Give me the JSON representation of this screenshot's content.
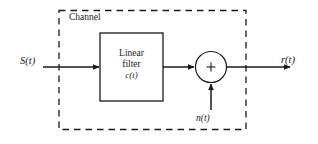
{
  "diagram": {
    "background_color": "#ffffff",
    "line_color": "#1a1a1a",
    "channel_boundary": {
      "label": "Channel",
      "style": "dashed"
    },
    "input": {
      "label": "S(t)",
      "description": "transmitted signal input"
    },
    "output": {
      "label": "r(t)",
      "description": "received signal output"
    },
    "noise": {
      "label": "n(t)",
      "description": "additive noise input"
    },
    "filter_block": {
      "line1": "Linear",
      "line2": "filter",
      "line3": "c(t)",
      "style": "solid"
    },
    "summing_junction": {
      "operator": "+",
      "shape": "circle"
    }
  }
}
